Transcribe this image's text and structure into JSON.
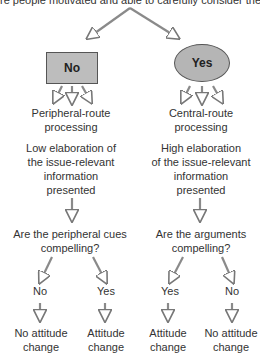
{
  "caption": "re people motivated and able to carefully consider the message?",
  "decision": {
    "no_label": "No",
    "yes_label": "Yes"
  },
  "left_branch": {
    "route": "Peripheral-route\nprocessing",
    "elaboration": "Low elaboration of\nthe issue-relevant\ninformation\npresented",
    "question": "Are the peripheral cues\ncompelling?",
    "outcomes": [
      {
        "answer": "No",
        "result": "No attitude\nchange"
      },
      {
        "answer": "Yes",
        "result": "Attitude\nchange"
      }
    ]
  },
  "right_branch": {
    "route": "Central-route\nprocessing",
    "elaboration": "High elaboration\nof the issue-relevant\ninformation\npresented",
    "question": "Are the arguments\ncompelling?",
    "outcomes": [
      {
        "answer": "Yes",
        "result": "Attitude\nchange"
      },
      {
        "answer": "No",
        "result": "No attitude\nchange"
      }
    ]
  },
  "colors": {
    "node_fill": "#bdbdbd",
    "arrow": "#888888",
    "text": "#333333"
  }
}
